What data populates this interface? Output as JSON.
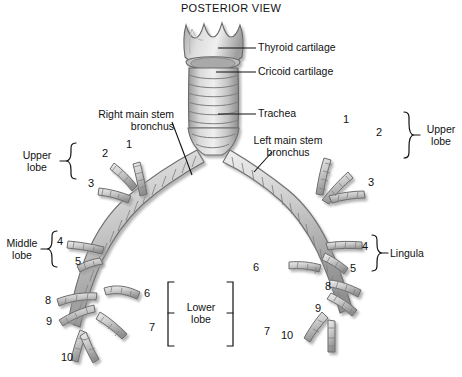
{
  "title": "POSTERIOR VIEW",
  "figure": {
    "view": "posterior",
    "style": "grayscale anatomical illustration"
  },
  "labels": {
    "thyroid_cartilage": "Thyroid cartilage",
    "cricoid_cartilage": "Cricoid cartilage",
    "trachea": "Trachea",
    "right_main_stem_bronchus": "Right main stem\nbronchus",
    "left_main_stem_bronchus": "Left main stem\nbronchus",
    "upper_lobe_left_side": "Upper\nlobe",
    "middle_lobe": "Middle\nlobe",
    "lower_lobe": "Lower\nlobe",
    "upper_lobe_right_side": "Upper\nlobe",
    "lingula": "Lingula"
  },
  "segment_numbers": {
    "left_side_upper_lobe": [
      "1",
      "2",
      "3"
    ],
    "left_side_middle_lobe": [
      "4",
      "5"
    ],
    "left_side_lower_lobe": [
      "6",
      "7",
      "8",
      "9",
      "10"
    ],
    "right_side_upper_lobe": [
      "1",
      "2",
      "3"
    ],
    "right_side_lingula": [
      "4",
      "5"
    ],
    "right_side_lower_lobe": [
      "6",
      "7",
      "8",
      "9",
      "10"
    ]
  },
  "numbers": {
    "L_upper_1": "1",
    "L_upper_2": "2",
    "L_upper_3": "3",
    "L_mid_4": "4",
    "L_mid_5": "5",
    "L_low_6": "6",
    "L_low_7": "7",
    "L_low_8": "8",
    "L_low_9": "9",
    "L_low_10": "10",
    "R_upper_1": "1",
    "R_upper_2": "2",
    "R_upper_3": "3",
    "R_ling_4": "4",
    "R_ling_5": "5",
    "R_low_6": "6",
    "R_low_7": "7",
    "R_low_8": "8",
    "R_low_9": "9",
    "R_low_10": "10"
  },
  "colors": {
    "line": "#1a1a1a",
    "cartilage_fill": "#c9c9c9",
    "cartilage_fill_light": "#dcdcdc",
    "cartilage_stroke": "#6e6e6e",
    "shadow": "#b6b6b6",
    "background": "#ffffff"
  }
}
